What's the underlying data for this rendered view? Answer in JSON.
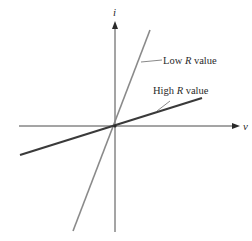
{
  "diagram": {
    "title": "",
    "axes": {
      "x_label": "v",
      "y_label": "i"
    },
    "lines": [
      {
        "name": "low-r",
        "label_prefix": "Low ",
        "label_var": "R",
        "label_suffix": " value",
        "color": "#8a8a8a",
        "width": 1.6
      },
      {
        "name": "high-r",
        "label_prefix": "High ",
        "label_var": "R",
        "label_suffix": " value",
        "color": "#3a3a3a",
        "width": 2.2
      }
    ],
    "colors": {
      "axis": "#4a4a4a",
      "background": "#ffffff"
    }
  }
}
